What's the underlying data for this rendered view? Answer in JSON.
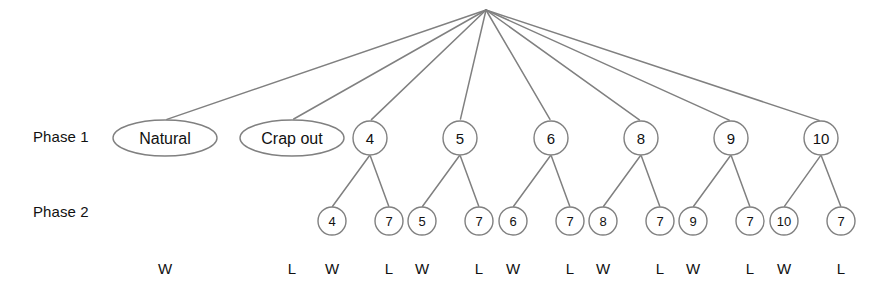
{
  "diagram": {
    "type": "probability-tree",
    "title": "",
    "colors": {
      "node_stroke": "#808080",
      "node_fill": "#ffffff",
      "edge": "#808080",
      "text": "#111111"
    },
    "row_labels": [
      {
        "id": "phase1",
        "label": "Phase 1"
      },
      {
        "id": "phase2",
        "label": "Phase 2"
      }
    ],
    "root": {
      "label": "",
      "x": 486,
      "y": 10
    },
    "phase1_nodes": [
      {
        "id": "natural",
        "label": "Natural",
        "shape": "ellipse",
        "cx": 165,
        "cy": 138,
        "rx": 52,
        "ry": 18
      },
      {
        "id": "crapout",
        "label": "Crap out",
        "shape": "ellipse",
        "cx": 292,
        "cy": 138,
        "rx": 52,
        "ry": 18
      },
      {
        "id": "point4",
        "label": "4",
        "shape": "circle",
        "cx": 370,
        "cy": 138,
        "r": 17
      },
      {
        "id": "point5",
        "label": "5",
        "shape": "circle",
        "cx": 460,
        "cy": 138,
        "r": 17
      },
      {
        "id": "point6",
        "label": "6",
        "shape": "circle",
        "cx": 551,
        "cy": 138,
        "r": 17
      },
      {
        "id": "point8",
        "label": "8",
        "shape": "circle",
        "cx": 641,
        "cy": 138,
        "r": 17
      },
      {
        "id": "point9",
        "label": "9",
        "shape": "circle",
        "cx": 731,
        "cy": 138,
        "r": 17
      },
      {
        "id": "point10",
        "label": "10",
        "shape": "circle",
        "cx": 821,
        "cy": 138,
        "r": 17
      }
    ],
    "phase2_nodes": [
      {
        "id": "p4-win",
        "parent": "point4",
        "label": "4",
        "cx": 332,
        "cy": 221,
        "r": 14
      },
      {
        "id": "p4-lose",
        "parent": "point4",
        "label": "7",
        "cx": 389,
        "cy": 221,
        "r": 14
      },
      {
        "id": "p5-win",
        "parent": "point5",
        "label": "5",
        "cx": 422,
        "cy": 221,
        "r": 14
      },
      {
        "id": "p5-lose",
        "parent": "point5",
        "label": "7",
        "cx": 479,
        "cy": 221,
        "r": 14
      },
      {
        "id": "p6-win",
        "parent": "point6",
        "label": "6",
        "cx": 513,
        "cy": 221,
        "r": 14
      },
      {
        "id": "p6-lose",
        "parent": "point6",
        "label": "7",
        "cx": 570,
        "cy": 221,
        "r": 14
      },
      {
        "id": "p8-win",
        "parent": "point8",
        "label": "8",
        "cx": 603,
        "cy": 221,
        "r": 14
      },
      {
        "id": "p8-lose",
        "parent": "point8",
        "label": "7",
        "cx": 660,
        "cy": 221,
        "r": 14
      },
      {
        "id": "p9-win",
        "parent": "point9",
        "label": "9",
        "cx": 693,
        "cy": 221,
        "r": 14
      },
      {
        "id": "p9-lose",
        "parent": "point9",
        "label": "7",
        "cx": 750,
        "cy": 221,
        "r": 14
      },
      {
        "id": "p10-win",
        "parent": "point10",
        "label": "10",
        "cx": 784,
        "cy": 221,
        "r": 14
      },
      {
        "id": "p10-lose",
        "parent": "point10",
        "label": "7",
        "cx": 841,
        "cy": 221,
        "r": 14
      }
    ],
    "outcomes": [
      {
        "id": "out-natural",
        "label": "W",
        "x": 165,
        "y": 268
      },
      {
        "id": "out-crapout",
        "label": "L",
        "x": 292,
        "y": 268
      },
      {
        "id": "out-p4-win",
        "label": "W",
        "x": 332,
        "y": 268
      },
      {
        "id": "out-p4-lose",
        "label": "L",
        "x": 389,
        "y": 268
      },
      {
        "id": "out-p5-win",
        "label": "W",
        "x": 422,
        "y": 268
      },
      {
        "id": "out-p5-lose",
        "label": "L",
        "x": 479,
        "y": 268
      },
      {
        "id": "out-p6-win",
        "label": "W",
        "x": 513,
        "y": 268
      },
      {
        "id": "out-p6-lose",
        "label": "L",
        "x": 570,
        "y": 268
      },
      {
        "id": "out-p8-win",
        "label": "W",
        "x": 603,
        "y": 268
      },
      {
        "id": "out-p8-lose",
        "label": "L",
        "x": 660,
        "y": 268
      },
      {
        "id": "out-p9-win",
        "label": "W",
        "x": 693,
        "y": 268
      },
      {
        "id": "out-p9-lose",
        "label": "L",
        "x": 750,
        "y": 268
      },
      {
        "id": "out-p10-win",
        "label": "W",
        "x": 784,
        "y": 268
      },
      {
        "id": "out-p10-lose",
        "label": "L",
        "x": 841,
        "y": 268
      }
    ]
  }
}
